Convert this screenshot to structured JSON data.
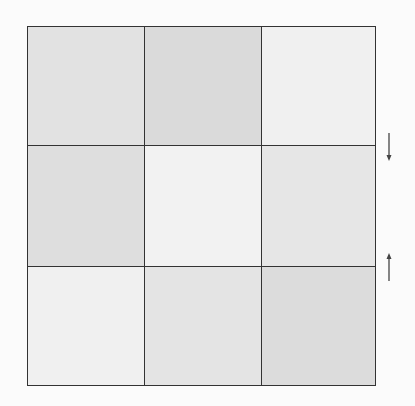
{
  "grid": {
    "rows": 3,
    "cols": 3,
    "cells": [
      {
        "row": 1,
        "col": 1,
        "shade": "#e2e2e2"
      },
      {
        "row": 1,
        "col": 2,
        "shade": "#dadada"
      },
      {
        "row": 1,
        "col": 3,
        "shade": "#f0f0f0"
      },
      {
        "row": 2,
        "col": 1,
        "shade": "#dedede"
      },
      {
        "row": 2,
        "col": 2,
        "shade": "#f2f2f2"
      },
      {
        "row": 2,
        "col": 3,
        "shade": "#e6e6e6"
      },
      {
        "row": 3,
        "col": 1,
        "shade": "#f0f0f0"
      },
      {
        "row": 3,
        "col": 2,
        "shade": "#e4e4e4"
      },
      {
        "row": 3,
        "col": 3,
        "shade": "#dcdcdc"
      }
    ],
    "border_color": "#333333"
  },
  "arrows": [
    {
      "name": "down-arrow-icon",
      "direction": "down",
      "glyph": "↓"
    },
    {
      "name": "up-arrow-icon",
      "direction": "up",
      "glyph": "↑"
    }
  ]
}
